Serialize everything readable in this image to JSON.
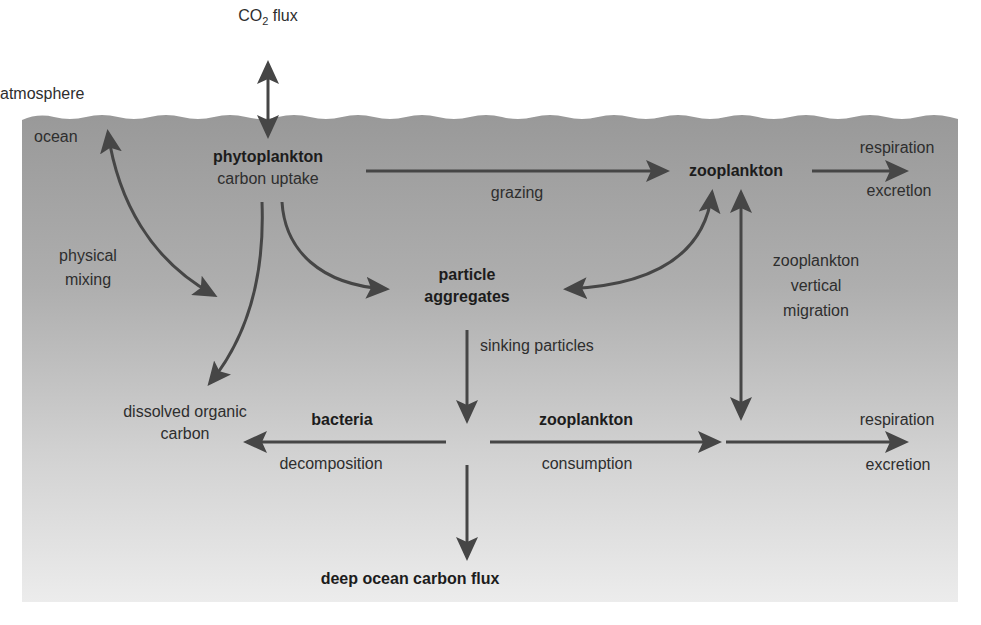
{
  "diagram": {
    "regions": {
      "atmosphere": "atmosphere",
      "ocean": "ocean"
    },
    "colors": {
      "ocean_top": "#9a9a9a",
      "ocean_bottom": "#ebebeb",
      "arrow": "#464646",
      "text": "#2e2e2e",
      "background": "#ffffff"
    },
    "nodes": {
      "co2_flux": {
        "prefix": "CO",
        "subscript": "2",
        "suffix": " flux"
      },
      "phytoplankton": {
        "name": "phytoplankton",
        "sub": "carbon uptake"
      },
      "zooplankton_top": {
        "name": "zooplankton"
      },
      "particle_aggregates": {
        "line1": "particle",
        "line2": "aggregates"
      },
      "bacteria": {
        "name": "bacteria"
      },
      "zooplankton_bottom": {
        "name": "zooplankton"
      },
      "dissolved_organic_carbon": {
        "line1": "dissolved organic",
        "line2": "carbon"
      },
      "deep_ocean_flux": {
        "name": "deep ocean carbon flux"
      },
      "respiration_top": {
        "line1": "respiration",
        "line2": "excretlon"
      },
      "respiration_bottom": {
        "line1": "respiration",
        "line2": "excretion"
      }
    },
    "process_labels": {
      "physical_mixing": {
        "line1": "physical",
        "line2": "mixing"
      },
      "grazing": "grazing",
      "sinking_particles": "sinking particles",
      "vertical_migration": {
        "line1": "zooplankton",
        "line2": "vertical",
        "line3": "migration"
      },
      "decomposition": "decomposition",
      "consumption": "consumption"
    },
    "edges": [
      {
        "from": "atmosphere",
        "to": "phytoplankton",
        "label": "CO2 flux",
        "bidirectional": true
      },
      {
        "from": "ocean surface",
        "to": "ocean interior",
        "label": "physical mixing",
        "bidirectional": true
      },
      {
        "from": "phytoplankton",
        "to": "zooplankton",
        "label": "grazing"
      },
      {
        "from": "phytoplankton",
        "to": "particle aggregates",
        "label": ""
      },
      {
        "from": "phytoplankton",
        "to": "dissolved organic carbon",
        "label": ""
      },
      {
        "from": "particle aggregates",
        "to": "zooplankton",
        "label": "",
        "bidirectional": true
      },
      {
        "from": "zooplankton",
        "to": "respiration excretion",
        "label": ""
      },
      {
        "from": "zooplankton",
        "to": "depth",
        "label": "zooplankton vertical migration",
        "bidirectional": true
      },
      {
        "from": "particle aggregates",
        "to": "junction",
        "label": "sinking particles"
      },
      {
        "from": "junction",
        "to": "dissolved organic carbon",
        "label": "bacteria decomposition"
      },
      {
        "from": "junction",
        "to": "respiration excretion",
        "label": "zooplankton consumption"
      },
      {
        "from": "junction",
        "to": "deep ocean carbon flux",
        "label": ""
      }
    ]
  }
}
